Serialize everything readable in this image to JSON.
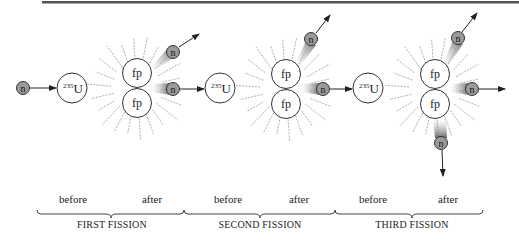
{
  "diagram": {
    "title_bar_color": "#555555",
    "labels": {
      "neutron": "n",
      "fission_product": "fp",
      "uranium_mass": "235",
      "uranium_symbol": "U"
    },
    "stages": [
      {
        "name": "FIRST FISSION",
        "before": "before",
        "after": "after"
      },
      {
        "name": "SECOND FISSION",
        "before": "before",
        "after": "after"
      },
      {
        "name": "THIRD FISSION",
        "before": "before",
        "after": "after"
      }
    ],
    "colors": {
      "neutron_fill": "#9a9a9a",
      "nucleus_fill": "#ffffff",
      "outline": "#333333",
      "rays": "#9a9a9a"
    }
  }
}
